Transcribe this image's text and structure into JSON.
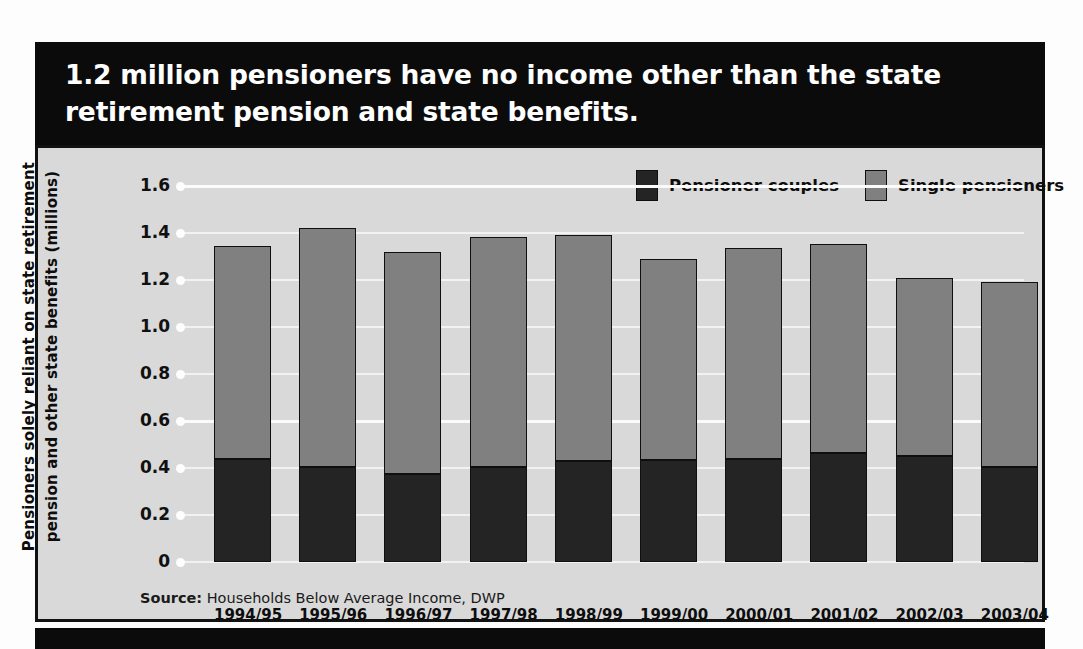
{
  "title": "1.2 million pensioners have no income other than the state retirement pension and state benefits.",
  "colors": {
    "banner_background": "#0b0b0b",
    "banner_text": "#ffffff",
    "plot_background": "#d9d9d9",
    "frame": "#111111",
    "pensioner_couples": "#242424",
    "single_pensioners": "#808080",
    "gridline": "#f2f2f2"
  },
  "legend": {
    "position": "top-right",
    "items": [
      {
        "label": "Pensioner couples",
        "color": "#242424"
      },
      {
        "label": "Single pensioners",
        "color": "#808080"
      }
    ]
  },
  "source": {
    "prefix": "Source:",
    "text": " Households Below Average Income, DWP"
  },
  "chart_data": {
    "type": "bar",
    "title": "1.2 million pensioners have no income other than the state retirement pension and state benefits.",
    "subtitle": "",
    "stacked": true,
    "xlabel": "",
    "ylabel": "Pensioners solely reliant on state retirement pension and other state benefits (millions)",
    "ylabel_lines": [
      "Pensioners solely reliant on state retirement",
      "pension and other state benefits (millions)"
    ],
    "ylim": [
      0,
      1.6
    ],
    "ytick_labels": [
      "1.6",
      "1.4",
      "1.2",
      "1.0",
      "0.8",
      "0.6",
      "0.4",
      "0.2",
      "0"
    ],
    "ytick_values": [
      1.6,
      1.4,
      1.2,
      1.0,
      0.8,
      0.6,
      0.4,
      0.2,
      0
    ],
    "grid": true,
    "grid_axis": "y",
    "legend_position": "top-right",
    "categories": [
      "1994/95",
      "1995/96",
      "1996/97",
      "1997/98",
      "1998/99",
      "1999/00",
      "2000/01",
      "2001/02",
      "2002/03",
      "2003/04"
    ],
    "series": [
      {
        "name": "Pensioner couples",
        "color": "#242424",
        "values": [
          0.44,
          0.405,
          0.375,
          0.405,
          0.43,
          0.435,
          0.44,
          0.465,
          0.45,
          0.405
        ]
      },
      {
        "name": "Single pensioners",
        "color": "#808080",
        "values": [
          0.905,
          1.015,
          0.945,
          0.98,
          0.96,
          0.855,
          0.895,
          0.89,
          0.76,
          0.785
        ]
      }
    ],
    "totals": [
      1.345,
      1.42,
      1.32,
      1.385,
      1.39,
      1.29,
      1.335,
      1.355,
      1.21,
      1.19
    ]
  }
}
